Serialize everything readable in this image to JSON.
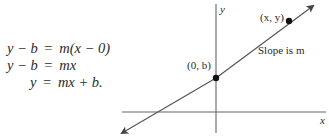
{
  "equations": [
    {
      "lhs": "y − b",
      "eq": "=",
      "rhs": "m(x − 0)"
    },
    {
      "lhs": "y − b",
      "eq": "=",
      "rhs": "mx"
    },
    {
      "lhs": "y",
      "eq": "=",
      "rhs": "mx + b."
    }
  ],
  "graph": {
    "x_axis_label": "x",
    "y_axis_label": "y",
    "point_intercept_label": "(0, b)",
    "point_general_label": "(x, y)",
    "slope_label": "Slope is m",
    "colors": {
      "ink": "#2a2a2a",
      "line": "#555555",
      "axis": "#666666"
    }
  }
}
